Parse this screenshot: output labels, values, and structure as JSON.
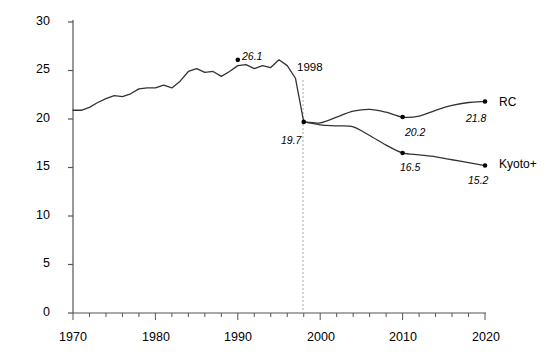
{
  "chart_data": {
    "type": "line",
    "title": "",
    "xlabel": "",
    "ylabel": "Carbon emissions (MtC)",
    "xlim": [
      1970,
      2020
    ],
    "ylim": [
      0,
      30
    ],
    "xticks": [
      1970,
      1980,
      1990,
      2000,
      2010,
      2020
    ],
    "xtick_labels": [
      "1970",
      "1980",
      "1990",
      "2000",
      "2010",
      "2020"
    ],
    "minor_xtick_interval": 2,
    "yticks": [
      0,
      5,
      10,
      15,
      20,
      25,
      30
    ],
    "ytick_labels": [
      "0",
      "5",
      "10",
      "15",
      "20",
      "25",
      "30"
    ],
    "grid": false,
    "legend": "inline-right-end-labels",
    "reference_line": {
      "x": 1998,
      "label": "1998",
      "style": "dotted",
      "color": "#999999"
    },
    "annotations": [
      {
        "text": "26.1",
        "x": 1990,
        "y": 26.1,
        "marker": true,
        "italic": true
      },
      {
        "text": "19.7",
        "x": 1998,
        "y": 19.7,
        "marker": true,
        "italic": true
      },
      {
        "text": "20.2",
        "x": 2010,
        "y": 20.2,
        "marker": true,
        "italic": true
      },
      {
        "text": "21.8",
        "x": 2020,
        "y": 21.8,
        "marker": true,
        "italic": true
      },
      {
        "text": "16.5",
        "x": 2010,
        "y": 16.5,
        "marker": true,
        "italic": true
      },
      {
        "text": "15.2",
        "x": 2020,
        "y": 15.2,
        "marker": true,
        "italic": true
      }
    ],
    "series": [
      {
        "name": "Historic",
        "label": "",
        "color": "#333333",
        "x": [
          1970,
          1971,
          1972,
          1973,
          1974,
          1975,
          1976,
          1977,
          1978,
          1979,
          1980,
          1981,
          1982,
          1983,
          1984,
          1985,
          1986,
          1987,
          1988,
          1989,
          1990,
          1991,
          1992,
          1993,
          1994,
          1995,
          1996,
          1997,
          1998
        ],
        "values": [
          20.9,
          20.9,
          21.2,
          21.7,
          22.1,
          22.4,
          22.3,
          22.6,
          23.1,
          23.2,
          23.2,
          23.5,
          23.2,
          23.9,
          24.9,
          25.2,
          24.8,
          24.9,
          24.4,
          24.9,
          25.5,
          25.6,
          25.2,
          25.5,
          25.3,
          26.1,
          25.5,
          24.2,
          19.7
        ]
      },
      {
        "name": "RC",
        "label": "RC",
        "color": "#333333",
        "x": [
          1998,
          2000,
          2002,
          2004,
          2006,
          2008,
          2010,
          2012,
          2014,
          2016,
          2018,
          2020
        ],
        "values": [
          19.7,
          19.6,
          20.2,
          20.8,
          21.0,
          20.7,
          20.2,
          20.3,
          20.9,
          21.4,
          21.7,
          21.8
        ]
      },
      {
        "name": "Kyoto+",
        "label": "Kyoto+",
        "color": "#333333",
        "x": [
          1998,
          2000,
          2002,
          2004,
          2006,
          2008,
          2010,
          2012,
          2014,
          2016,
          2018,
          2020
        ],
        "values": [
          19.7,
          19.4,
          19.3,
          19.2,
          18.3,
          17.3,
          16.5,
          16.3,
          16.1,
          15.8,
          15.5,
          15.2
        ]
      }
    ]
  },
  "axis": {
    "y_title": "Carbon emissions (MtC)"
  },
  "series_labels": {
    "rc": "RC",
    "kyoto": "Kyoto+"
  },
  "ref": {
    "year_label": "1998"
  },
  "values": {
    "peak": "26.1",
    "base": "19.7",
    "rc_2010": "20.2",
    "rc_2020": "21.8",
    "ky_2010": "16.5",
    "ky_2020": "15.2"
  },
  "yticks": [
    "30",
    "25",
    "20",
    "15",
    "10",
    "5",
    "0"
  ],
  "xticks": [
    "1970",
    "1980",
    "1990",
    "2000",
    "2010",
    "2020"
  ]
}
